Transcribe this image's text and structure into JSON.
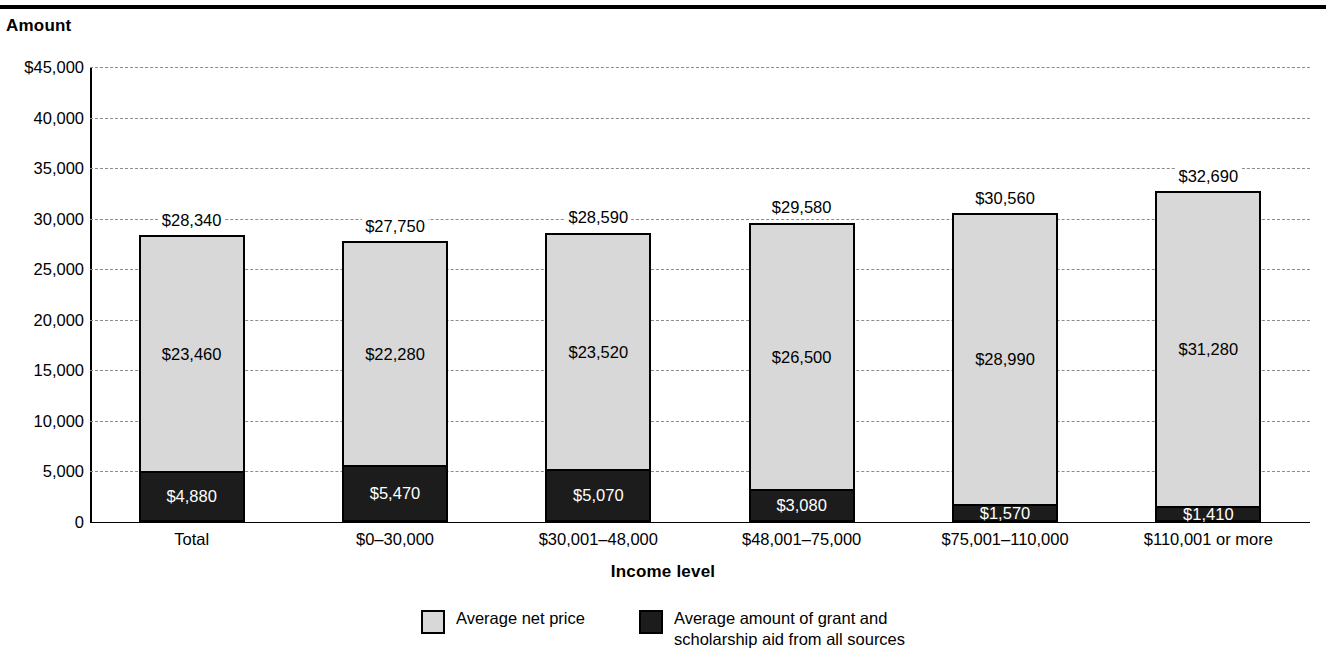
{
  "axis": {
    "y_title": "Amount",
    "x_title": "Income level",
    "y_ticks": [
      "$45,000",
      "40,000",
      "35,000",
      "30,000",
      "25,000",
      "20,000",
      "15,000",
      "10,000",
      "5,000",
      "0"
    ]
  },
  "legend": {
    "items": [
      {
        "key": "net",
        "label": "Average net price"
      },
      {
        "key": "aid",
        "label": "Average amount of grant and\nscholarship aid from all sources"
      }
    ]
  },
  "chart_data": {
    "type": "bar",
    "title": "",
    "subtitle": "",
    "xlabel": "Income level",
    "ylabel": "Amount",
    "ylim": [
      0,
      45000
    ],
    "ytick_step": 5000,
    "grid": true,
    "stacked": true,
    "legend_position": "bottom",
    "categories": [
      "Total",
      "$0–30,000",
      "$30,001–48,000",
      "$48,001–75,000",
      "$75,001–110,000",
      "$110,001 or more"
    ],
    "series": [
      {
        "name": "Average amount of grant and scholarship aid from all sources",
        "color": "#1c1c1c",
        "values": [
          4880,
          5470,
          5070,
          3080,
          1570,
          1410
        ],
        "labels": [
          "$4,880",
          "$5,470",
          "$5,070",
          "$3,080",
          "$1,570",
          "$1,410"
        ]
      },
      {
        "name": "Average net price",
        "color": "#d8d8d8",
        "values": [
          23460,
          22280,
          23520,
          26500,
          28990,
          31280
        ],
        "labels": [
          "$23,460",
          "$22,280",
          "$23,520",
          "$26,500",
          "$28,990",
          "$31,280"
        ]
      }
    ],
    "totals": [
      28340,
      27750,
      28590,
      29580,
      30560,
      32690
    ],
    "total_labels": [
      "$28,340",
      "$27,750",
      "$28,590",
      "$29,580",
      "$30,560",
      "$32,690"
    ]
  }
}
